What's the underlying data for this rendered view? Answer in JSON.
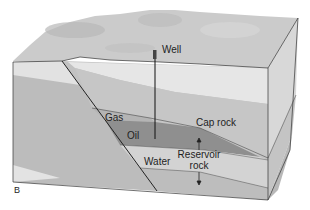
{
  "figure": {
    "panel_label": "B",
    "labels": {
      "well": "Well",
      "gas": "Gas",
      "oil": "Oil",
      "cap_rock": "Cap rock",
      "water": "Water",
      "reservoir_rock_line1": "Reservoir",
      "reservoir_rock_line2": "rock"
    },
    "colors": {
      "background": "#ffffff",
      "surface": "#cfcfcf",
      "light_layer": "#e4e4e4",
      "mid_layer": "#bdbdbd",
      "cap_rock": "#c4c4c4",
      "oil": "#8f8f8f",
      "gas": "#b2b2b2",
      "water": "#d2d2d2",
      "right_face": "#c9c9c9",
      "lines": "#2a2a2a"
    }
  }
}
